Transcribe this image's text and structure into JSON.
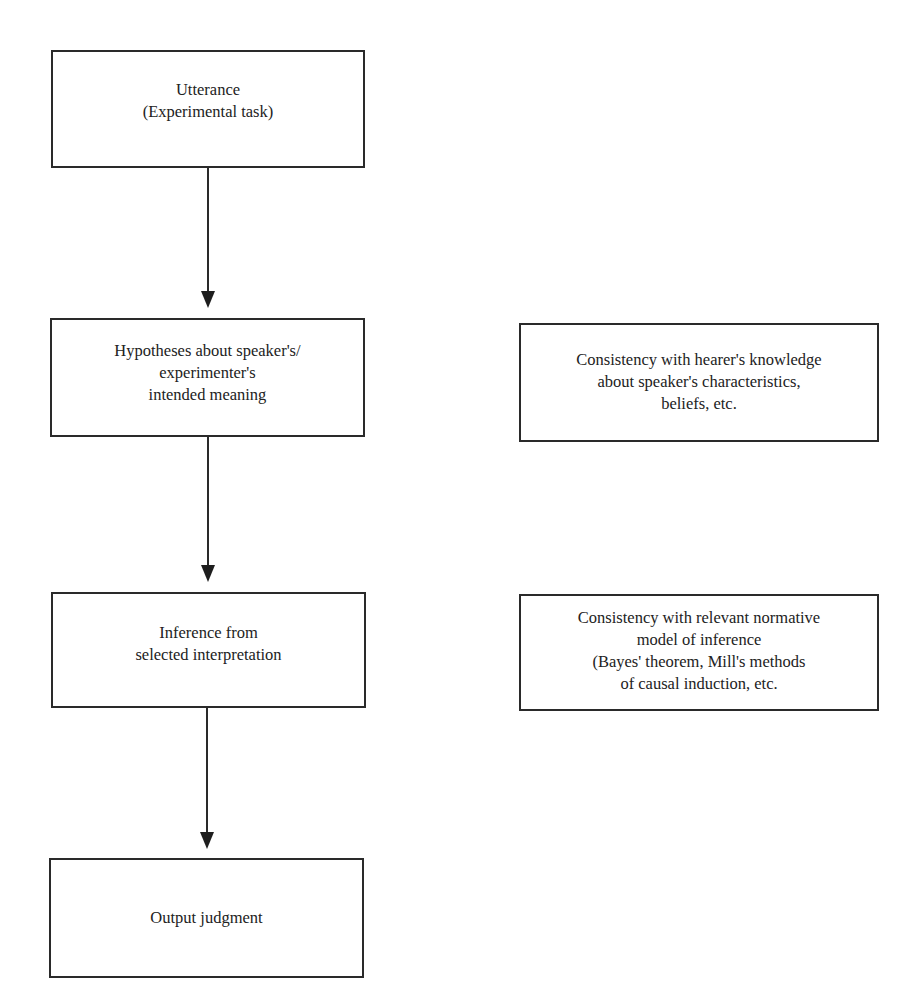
{
  "diagram": {
    "flow": [
      {
        "id": "utterance",
        "lines": [
          "Utterance",
          "(Experimental task)"
        ]
      },
      {
        "id": "hypotheses",
        "lines": [
          "Hypotheses about speaker's/",
          "experimenter's",
          "intended meaning"
        ]
      },
      {
        "id": "inference",
        "lines": [
          "Inference from",
          "selected interpretation"
        ]
      },
      {
        "id": "output",
        "lines": [
          "Output judgment"
        ]
      }
    ],
    "constraints": [
      {
        "id": "consistency-knowledge",
        "aligned_with": "hypotheses",
        "lines": [
          "Consistency with hearer's knowledge",
          "about speaker's characteristics,",
          "beliefs, etc."
        ]
      },
      {
        "id": "consistency-normative",
        "aligned_with": "inference",
        "lines": [
          "Consistency with relevant normative",
          "model of inference",
          "(Bayes' theorem, Mill's methods",
          "of causal induction, etc."
        ]
      }
    ],
    "arrows": [
      {
        "from": "utterance",
        "to": "hypotheses"
      },
      {
        "from": "hypotheses",
        "to": "inference"
      },
      {
        "from": "inference",
        "to": "output"
      }
    ],
    "caption": {
      "text": "",
      "note": "caption clipped at bottom edge; text illegible"
    }
  }
}
